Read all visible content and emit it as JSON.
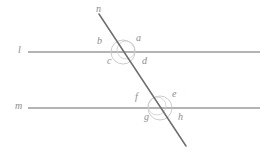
{
  "diagram": {
    "canvas": {
      "width": 266,
      "height": 153,
      "background": "#ffffff"
    },
    "colors": {
      "parallel_line": "#9a9a9a",
      "transversal_line": "#6e6e6e",
      "arc": "#bdbdbd",
      "label_text": "#8d8d8d"
    },
    "lines": [
      {
        "name": "l",
        "label": "l",
        "type": "parallel",
        "label_x": 18,
        "label_y": 45,
        "x1": 28,
        "y1": 52,
        "x2": 260,
        "y2": 52
      },
      {
        "name": "m",
        "label": "m",
        "type": "parallel",
        "label_x": 15,
        "label_y": 101,
        "x1": 28,
        "y1": 108,
        "x2": 260,
        "y2": 108
      },
      {
        "name": "n",
        "label": "n",
        "type": "transversal",
        "label_x": 96,
        "label_y": 4,
        "x1": 99,
        "y1": 14,
        "x2": 186,
        "y2": 146
      }
    ],
    "intersections": [
      {
        "name": "intersection-l-n",
        "x": 123,
        "y": 52,
        "arc_radius": 12,
        "angles": [
          {
            "label": "b",
            "position": "upper-left",
            "x": 97,
            "y": 36
          },
          {
            "label": "a",
            "position": "upper-right",
            "x": 136,
            "y": 33
          },
          {
            "label": "c",
            "position": "lower-left",
            "x": 107,
            "y": 56
          },
          {
            "label": "d",
            "position": "lower-right",
            "x": 142,
            "y": 56
          }
        ]
      },
      {
        "name": "intersection-m-n",
        "x": 160,
        "y": 108,
        "arc_radius": 12,
        "angles": [
          {
            "label": "f",
            "position": "upper-left",
            "x": 135,
            "y": 92
          },
          {
            "label": "e",
            "position": "upper-right",
            "x": 172,
            "y": 89
          },
          {
            "label": "g",
            "position": "lower-left",
            "x": 144,
            "y": 112
          },
          {
            "label": "h",
            "position": "lower-right",
            "x": 178,
            "y": 112
          }
        ]
      }
    ]
  }
}
